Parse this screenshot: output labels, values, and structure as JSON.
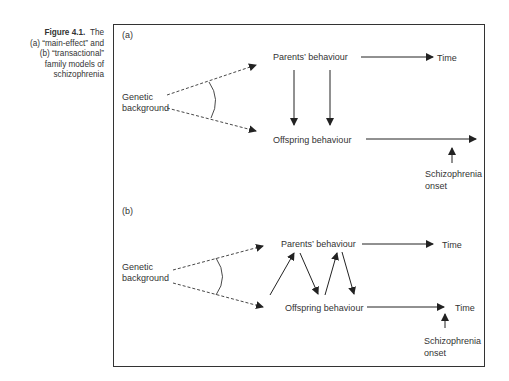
{
  "caption": {
    "label": "Figure 4.1.",
    "lines": [
      "The",
      "(a) “main-effect” and",
      "(b) “transactional”",
      "family models of",
      "schizophrenia"
    ]
  },
  "panel_a": {
    "label": "(a)",
    "genetic": [
      "Genetic",
      "background"
    ],
    "parents": "Parents’ behaviour",
    "offspring": "Offspring behaviour",
    "time": "Time",
    "onset": [
      "Schizophrenia",
      "onset"
    ]
  },
  "panel_b": {
    "label": "(b)",
    "genetic": [
      "Genetic",
      "background"
    ],
    "parents": "Parents’ behaviour",
    "offspring": "Offspring behaviour",
    "time_top": "Time",
    "time_bottom": "Time",
    "onset": [
      "Schizophrenia",
      "onset"
    ]
  }
}
